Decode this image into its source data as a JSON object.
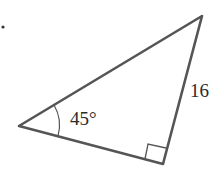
{
  "diagram": {
    "type": "right-triangle",
    "bullet": "•",
    "vertices": {
      "left": [
        19,
        126
      ],
      "top": [
        202,
        16
      ],
      "right_angle": [
        163,
        164
      ]
    },
    "angle_label": "45°",
    "side_label": "16",
    "colors": {
      "stroke": "#555555",
      "text": "#2a2a2a",
      "background": "#ffffff"
    }
  }
}
